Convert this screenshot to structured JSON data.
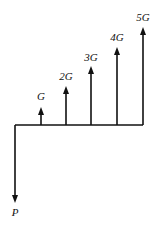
{
  "diagram": {
    "type": "cash-flow-diagram",
    "baseline": {
      "x1": 15,
      "x2": 143,
      "y": 125
    },
    "present": {
      "label": "P",
      "x": 15,
      "arrow_end_y": 203,
      "label_y": 216
    },
    "gradient_arrows": [
      {
        "label": "G",
        "x": 41,
        "top_y": 107,
        "label_y": 100
      },
      {
        "label": "2G",
        "x": 66,
        "top_y": 86,
        "label_y": 80
      },
      {
        "label": "3G",
        "x": 91,
        "top_y": 66,
        "label_y": 61
      },
      {
        "label": "4G",
        "x": 117,
        "top_y": 47,
        "label_y": 41
      },
      {
        "label": "5G",
        "x": 143,
        "top_y": 27,
        "label_y": 21
      }
    ],
    "color": "#111111"
  }
}
